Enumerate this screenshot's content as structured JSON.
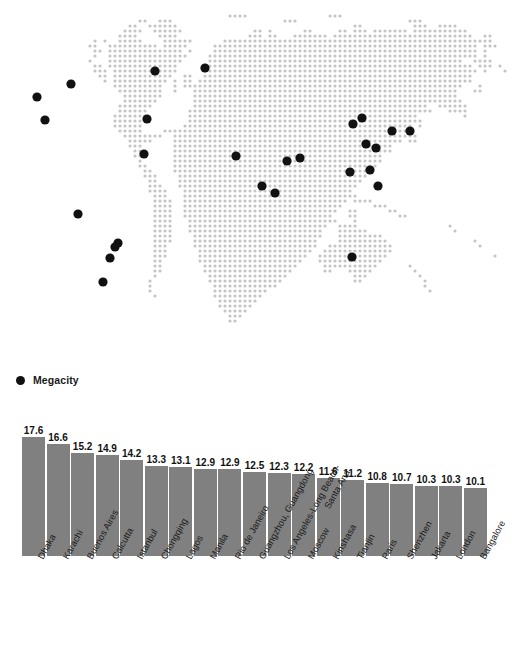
{
  "legend": {
    "marker_icon": "filled-circle-icon",
    "label": "Megacity",
    "marker_color": "#111111"
  },
  "map": {
    "name": "world-dot-matrix-map",
    "dot_color": "#c4c4c4",
    "marker_color": "#111111",
    "markers": [
      {
        "name": "New York",
        "x": 71,
        "y": 84
      },
      {
        "name": "Los Angeles",
        "x": 37,
        "y": 97
      },
      {
        "name": "Mexico City",
        "x": 45,
        "y": 120
      },
      {
        "name": "London",
        "x": 155,
        "y": 71
      },
      {
        "name": "Paris",
        "x": 147,
        "y": 119
      },
      {
        "name": "Istanbul",
        "x": 144,
        "y": 154
      },
      {
        "name": "Moscow",
        "x": 205,
        "y": 68
      },
      {
        "name": "Lagos",
        "x": 78,
        "y": 214
      },
      {
        "name": "Kinshasa",
        "x": 115,
        "y": 247
      },
      {
        "name": "Cairo",
        "x": 236,
        "y": 156
      },
      {
        "name": "Karachi",
        "x": 262,
        "y": 186
      },
      {
        "name": "Calcutta",
        "x": 287,
        "y": 161
      },
      {
        "name": "Dhaka",
        "x": 300,
        "y": 158
      },
      {
        "name": "Bangalore",
        "x": 275,
        "y": 193
      },
      {
        "name": "Chongqing",
        "x": 353,
        "y": 124
      },
      {
        "name": "Beijing",
        "x": 362,
        "y": 118
      },
      {
        "name": "Tianjin",
        "x": 366,
        "y": 144
      },
      {
        "name": "Shanghai",
        "x": 376,
        "y": 148
      },
      {
        "name": "Seoul",
        "x": 392,
        "y": 131
      },
      {
        "name": "Tokyo",
        "x": 410,
        "y": 131
      },
      {
        "name": "Guangzhou",
        "x": 370,
        "y": 170
      },
      {
        "name": "Shenzhen",
        "x": 378,
        "y": 186
      },
      {
        "name": "Manila",
        "x": 350,
        "y": 172
      },
      {
        "name": "Jakarta",
        "x": 352,
        "y": 257
      },
      {
        "name": "Rio de Janeiro",
        "x": 118,
        "y": 243
      },
      {
        "name": "Buenos Aires",
        "x": 103,
        "y": 282
      },
      {
        "name": "Sao Paulo",
        "x": 110,
        "y": 258
      }
    ]
  },
  "chart_data": {
    "type": "bar",
    "title": "",
    "xlabel": "",
    "ylabel": "",
    "ylim": [
      0,
      17.6
    ],
    "grid": false,
    "legend_position": "above-chart",
    "bar_color": "#808080",
    "categories": [
      "Dhaka",
      "Karachi",
      "Buenos Aires",
      "Calcutta",
      "Istanbul",
      "Chongqing",
      "Lagos",
      "Manila",
      "Rio de Janeiro",
      "Guangzhou, Guangdong",
      "Los Angeles-Long Beach-Santa Ana",
      "Moscow",
      "Kinshasa",
      "Tianjin",
      "Paris",
      "Shenzhen",
      "Jakarta",
      "London",
      "Bangalore"
    ],
    "categories_display": [
      {
        "line1": "Dhaka",
        "line2": ""
      },
      {
        "line1": "Karachi",
        "line2": ""
      },
      {
        "line1": "Buenos Aires",
        "line2": ""
      },
      {
        "line1": "Calcutta",
        "line2": ""
      },
      {
        "line1": "Istanbul",
        "line2": ""
      },
      {
        "line1": "Chongqing",
        "line2": ""
      },
      {
        "line1": "Lagos",
        "line2": ""
      },
      {
        "line1": "Manila",
        "line2": ""
      },
      {
        "line1": "Rio de Janeiro",
        "line2": ""
      },
      {
        "line1": "Guangzhou, Guangdong",
        "line2": ""
      },
      {
        "line1": "Los Angeles-Long Beach-",
        "line2": "Santa Ana"
      },
      {
        "line1": "Moscow",
        "line2": ""
      },
      {
        "line1": "Kinshasa",
        "line2": ""
      },
      {
        "line1": "Tianjin",
        "line2": ""
      },
      {
        "line1": "Paris",
        "line2": ""
      },
      {
        "line1": "Shenzhen",
        "line2": ""
      },
      {
        "line1": "Jakarta",
        "line2": ""
      },
      {
        "line1": "London",
        "line2": ""
      },
      {
        "line1": "Bangalore",
        "line2": ""
      }
    ],
    "values": [
      17.6,
      16.6,
      15.2,
      14.9,
      14.2,
      13.3,
      13.1,
      12.9,
      12.9,
      12.5,
      12.3,
      12.2,
      11.6,
      11.2,
      10.8,
      10.7,
      10.3,
      10.3,
      10.1
    ],
    "value_labels": [
      "17.6",
      "16.6",
      "15.2",
      "14.9",
      "14.2",
      "13.3",
      "13.1",
      "12.9",
      "12.9",
      "12.5",
      "12.3",
      "12.2",
      "11.6",
      "11.2",
      "10.8",
      "10.7",
      "10.3",
      "10.3",
      "10.1"
    ]
  }
}
